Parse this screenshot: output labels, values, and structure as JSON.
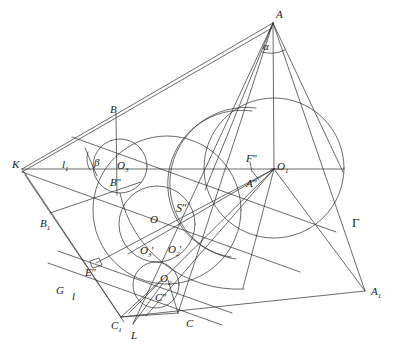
{
  "figure": {
    "type": "geometry-construction-diagram",
    "stroke_color": "#2b2b2b",
    "background_color": "#ffffff",
    "line_width": 0.7
  },
  "labels": [
    {
      "id": "A",
      "text": "A",
      "sub": "",
      "prime": "",
      "x": 276,
      "y": 9,
      "italic": true
    },
    {
      "id": "alpha",
      "text": "α",
      "sub": "",
      "prime": "",
      "x": 263,
      "y": 41,
      "italic": true
    },
    {
      "id": "B",
      "text": "B",
      "sub": "",
      "prime": "",
      "x": 110,
      "y": 104,
      "italic": true
    },
    {
      "id": "K",
      "text": "K",
      "sub": "",
      "prime": "",
      "x": 12,
      "y": 159,
      "italic": true
    },
    {
      "id": "l1",
      "text": "l",
      "sub": "1",
      "prime": "",
      "x": 62,
      "y": 159,
      "italic": true
    },
    {
      "id": "beta",
      "text": "β",
      "sub": "",
      "prime": "",
      "x": 94,
      "y": 157,
      "italic": true
    },
    {
      "id": "O3",
      "text": "O",
      "sub": "3",
      "prime": "",
      "x": 117,
      "y": 160,
      "italic": true
    },
    {
      "id": "Bpp",
      "text": "B",
      "sub": "",
      "prime": "''",
      "x": 110,
      "y": 177,
      "italic": true
    },
    {
      "id": "Fpp",
      "text": "F",
      "sub": "",
      "prime": "''",
      "x": 246,
      "y": 153,
      "italic": true
    },
    {
      "id": "O1",
      "text": "O",
      "sub": "1",
      "prime": "",
      "x": 277,
      "y": 161,
      "italic": true
    },
    {
      "id": "App",
      "text": "A",
      "sub": "",
      "prime": "''",
      "x": 246,
      "y": 178,
      "italic": true
    },
    {
      "id": "Spp",
      "text": "S",
      "sub": "",
      "prime": "''",
      "x": 176,
      "y": 202,
      "italic": true
    },
    {
      "id": "O",
      "text": "O",
      "sub": "",
      "prime": "",
      "x": 150,
      "y": 214,
      "italic": true
    },
    {
      "id": "B1",
      "text": "B",
      "sub": "1",
      "prime": "",
      "x": 40,
      "y": 218,
      "italic": true
    },
    {
      "id": "Gamma",
      "text": "Γ",
      "sub": "",
      "prime": "",
      "x": 352,
      "y": 216,
      "italic": false
    },
    {
      "id": "O3p",
      "text": "O",
      "sub": "3",
      "prime": "'",
      "x": 140,
      "y": 245,
      "italic": true
    },
    {
      "id": "O2p",
      "text": "O",
      "sub": "2",
      "prime": "'",
      "x": 168,
      "y": 244,
      "italic": true
    },
    {
      "id": "Epp",
      "text": "E",
      "sub": "",
      "prime": "''",
      "x": 85,
      "y": 267,
      "italic": true
    },
    {
      "id": "O2",
      "text": "O",
      "sub": "2",
      "prime": "",
      "x": 160,
      "y": 273,
      "italic": true
    },
    {
      "id": "G",
      "text": "G",
      "sub": "",
      "prime": "",
      "x": 56,
      "y": 285,
      "italic": true
    },
    {
      "id": "l",
      "text": "l",
      "sub": "",
      "prime": "",
      "x": 72,
      "y": 291,
      "italic": true
    },
    {
      "id": "Cpp",
      "text": "C",
      "sub": "",
      "prime": "''",
      "x": 155,
      "y": 292,
      "italic": true
    },
    {
      "id": "A1",
      "text": "A",
      "sub": "1",
      "prime": "",
      "x": 371,
      "y": 286,
      "italic": true
    },
    {
      "id": "C1",
      "text": "C",
      "sub": "1",
      "prime": "",
      "x": 111,
      "y": 320,
      "italic": true
    },
    {
      "id": "L",
      "text": "L",
      "sub": "",
      "prime": "",
      "x": 131,
      "y": 330,
      "italic": true
    },
    {
      "id": "C",
      "text": "C",
      "sub": "",
      "prime": "",
      "x": 186,
      "y": 318,
      "italic": true
    }
  ],
  "points": {
    "A": {
      "x": 273,
      "y": 23
    },
    "K": {
      "x": 22,
      "y": 169
    },
    "O1": {
      "x": 274,
      "y": 168
    },
    "O3": {
      "x": 120,
      "y": 166
    },
    "O": {
      "x": 157,
      "y": 224
    },
    "O2": {
      "x": 156,
      "y": 285
    },
    "B": {
      "x": 116,
      "y": 113
    },
    "Bpp": {
      "x": 117,
      "y": 172
    },
    "App": {
      "x": 255,
      "y": 176
    },
    "Fpp": {
      "x": 250,
      "y": 165
    },
    "Cpp": {
      "x": 156,
      "y": 288
    },
    "C": {
      "x": 178,
      "y": 313
    },
    "C1": {
      "x": 121,
      "y": 317
    },
    "L": {
      "x": 133,
      "y": 324
    },
    "B1": {
      "x": 50,
      "y": 213
    },
    "A1": {
      "x": 365,
      "y": 291
    },
    "G": {
      "x": 68,
      "y": 283
    },
    "Epp": {
      "x": 96,
      "y": 263
    },
    "Spp": {
      "x": 172,
      "y": 210
    }
  },
  "circles": [
    {
      "id": "big-right-circle",
      "cx": 274,
      "cy": 168,
      "r": 70,
      "note": "circumscribed-circle-at-O1"
    },
    {
      "id": "mid-left-circle",
      "cx": 167,
      "cy": 210,
      "r": 74,
      "note": "large-projected-ellipse-circle"
    },
    {
      "id": "small-O3-circle",
      "cx": 120,
      "cy": 166,
      "r": 27,
      "note": "escribed-circle-O3"
    },
    {
      "id": "center-O-circle",
      "cx": 157,
      "cy": 224,
      "r": 38,
      "note": "inscribed-circle-O"
    },
    {
      "id": "small-O2-circle",
      "cx": 156,
      "cy": 285,
      "r": 23,
      "note": "escribed-circle-O2"
    },
    {
      "id": "right-inner-arc",
      "cx": 236,
      "cy": 200,
      "r": 56,
      "note": "auxiliary-arc"
    }
  ]
}
